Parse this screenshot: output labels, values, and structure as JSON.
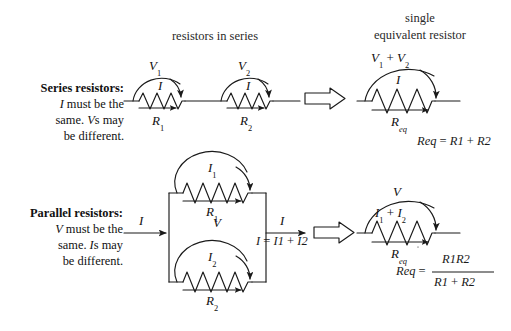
{
  "figure": {
    "title_series": "resistors in series",
    "title_equivalent_line1": "single",
    "title_equivalent_line2": "equivalent resistor",
    "ink_color": "#1a1a1a",
    "background": "#ffffff"
  },
  "series_row": {
    "description": {
      "line1": "Series resistors:",
      "line2": "I must be the",
      "line3": "same. Vs may",
      "line4": "be different."
    },
    "resistor1": {
      "voltage_label": "V",
      "voltage_sub": "1",
      "current_label": "I",
      "resistance_label": "R",
      "resistance_sub": "1"
    },
    "resistor2": {
      "voltage_label": "V",
      "voltage_sub": "2",
      "current_label": "I",
      "resistance_label": "R",
      "resistance_sub": "2"
    },
    "equivalent": {
      "voltage_label_1": "V",
      "voltage_sub_1": "1",
      "plus": "+",
      "voltage_label_2": "V",
      "voltage_sub_2": "2",
      "current_label": "I",
      "resistance_label": "R",
      "resistance_sub": "eq"
    },
    "formula": {
      "lhs": "R",
      "lhs_sub": "eq",
      "eq": "=",
      "t1": "R",
      "t1_sub": "1",
      "op": "+",
      "t2": "R",
      "t2_sub": "2"
    }
  },
  "parallel_row": {
    "description": {
      "line1": "Parallel resistors:",
      "line2": "V must be the",
      "line3": "same. Is may",
      "line4": "be different."
    },
    "input_current": "I",
    "branch_voltage": "V",
    "resistor1": {
      "current_label": "I",
      "current_sub": "1",
      "resistance_label": "R",
      "resistance_sub": "1"
    },
    "resistor2": {
      "current_label": "I",
      "current_sub": "2",
      "resistance_label": "R",
      "resistance_sub": "2"
    },
    "output": {
      "current_label": "I",
      "kcl_lhs": "I",
      "kcl_eq": "=",
      "kcl_t1": "I",
      "kcl_t1_sub": "1",
      "kcl_op": "+",
      "kcl_t2": "I",
      "kcl_t2_sub": "2"
    },
    "equivalent": {
      "voltage_label": "V",
      "current_label_1": "I",
      "current_sub_1": "1",
      "plus": "+",
      "current_label_2": "I",
      "current_sub_2": "2",
      "resistance_label": "R",
      "resistance_sub": "eq"
    },
    "formula": {
      "lhs": "R",
      "lhs_sub": "eq",
      "eq": "=",
      "num_t1": "R",
      "num_t1_sub": "1",
      "num_t2": "R",
      "num_t2_sub": "2",
      "den_t1": "R",
      "den_t1_sub": "1",
      "den_op": "+",
      "den_t2": "R",
      "den_t2_sub": "2"
    }
  }
}
